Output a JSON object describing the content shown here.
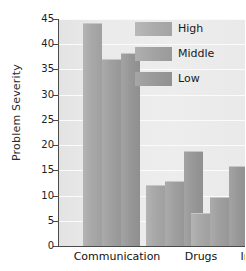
{
  "chart_data": {
    "type": "bar",
    "title": "",
    "xlabel": "",
    "ylabel": "Problem Severity",
    "categories": [
      "Communication",
      "Drugs",
      "Infidelity"
    ],
    "series": [
      {
        "name": "High",
        "values": [
          44.3,
          12.0,
          6.6
        ],
        "color": "#acacac"
      },
      {
        "name": "Middle",
        "values": [
          37.1,
          12.8,
          9.7
        ],
        "color": "#a3a3a3"
      },
      {
        "name": "Low",
        "values": [
          38.3,
          18.8,
          15.9
        ],
        "color": "#9a9a9a"
      }
    ],
    "ylim": [
      0,
      45
    ],
    "yticks": [
      0,
      5,
      10,
      15,
      20,
      25,
      30,
      35,
      40,
      45
    ],
    "ytick_labels": [
      "0",
      "5",
      "10",
      "15",
      "20",
      "25",
      "30",
      "35",
      "40",
      "45"
    ],
    "grid": true,
    "grid_axis": "y",
    "legend_position": "top-right",
    "plot_background": "#e8e8e8",
    "gridline_color": "#fbfbfb",
    "axis_color": "#4a4a4a"
  }
}
